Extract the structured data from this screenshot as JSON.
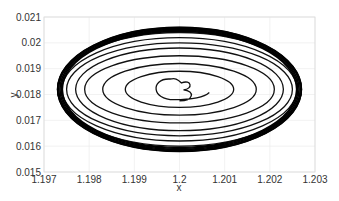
{
  "chart_data": {
    "type": "line",
    "title": "",
    "xlabel": "x",
    "ylabel": "y",
    "xlim": [
      1.197,
      1.203
    ],
    "ylim": [
      0.015,
      0.021
    ],
    "xticks": [
      "1.197",
      "1.198",
      "1.199",
      "1.2",
      "1.201",
      "1.202",
      "1.203"
    ],
    "yticks": [
      "0.015",
      "0.016",
      "0.017",
      "0.018",
      "0.019",
      "0.02",
      "0.021"
    ],
    "grid": true,
    "legend": null,
    "series": [
      {
        "name": "phase trajectory (spiral converging to limit cycle)",
        "description": "Trajectory spirals outward from near (1.2, 0.0178) to a stable limit cycle ellipse centered at (1.2, 0.0182)",
        "center": [
          1.2,
          0.0182
        ],
        "limit_cycle": {
          "x_range": [
            1.1973,
            1.2027
          ],
          "y_range": [
            0.0158,
            0.0206
          ]
        },
        "start_point": [
          1.2,
          0.01775
        ],
        "rings_semi_axes": [
          [
            0.0006,
            0.0004
          ],
          [
            0.0012,
            0.0007
          ],
          [
            0.0017,
            0.001
          ],
          [
            0.0021,
            0.0013
          ],
          [
            0.0023,
            0.0016
          ],
          [
            0.0025,
            0.0018
          ],
          [
            0.0026,
            0.002
          ],
          [
            0.0027,
            0.0022
          ],
          [
            0.0027,
            0.0024
          ]
        ]
      }
    ]
  },
  "axes": {
    "x_label": "x",
    "y_label": "y"
  }
}
